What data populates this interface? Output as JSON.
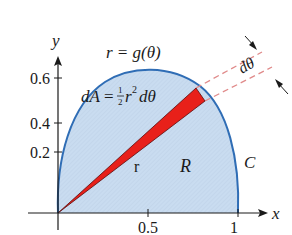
{
  "diagram": {
    "title_equation": "r = g(θ)",
    "area_element": {
      "lhs": "dA",
      "eq": "=",
      "frac_num": "1",
      "frac_den": "2",
      "r": "r",
      "sup": "2",
      "dtheta": "dθ"
    },
    "dtheta_label": "dθ",
    "radius_label": "r",
    "region_label": "R",
    "curve_label": "C",
    "axes": {
      "x_label": "x",
      "y_label": "y",
      "x_ticks": [
        "0.5",
        "1"
      ],
      "y_ticks": [
        "0.2",
        "0.4",
        "0.6"
      ]
    },
    "colors": {
      "region_fill": "#c9dcf0",
      "curve": "#2f6db5",
      "wedge": "#e8201a",
      "dashed": "#e08a8a",
      "axis": "#1a1a1a"
    }
  }
}
